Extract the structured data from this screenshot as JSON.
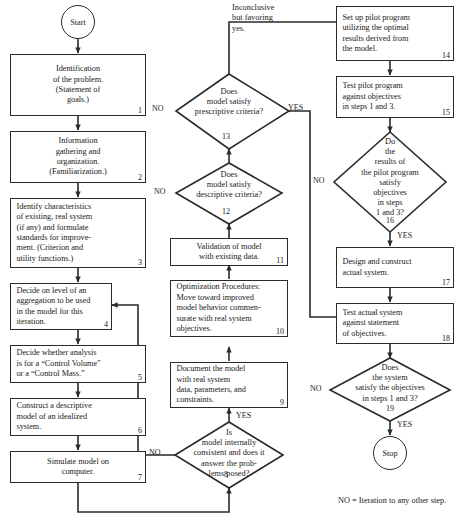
{
  "diagram": {
    "legend": "NO = Iteration to any other step.",
    "line_color": "#2a2a2a",
    "background": "#ffffff"
  },
  "terminators": {
    "start": "Start",
    "stop": "Stop"
  },
  "steps": [
    {
      "id": 1,
      "num": "1",
      "lines": [
        "Identification",
        "of the problem.",
        "(Statement of",
        "goals.)"
      ]
    },
    {
      "id": 2,
      "num": "2",
      "lines": [
        "Information",
        "gathering and",
        "organization.",
        "(Familiarization.)"
      ]
    },
    {
      "id": 3,
      "num": "3",
      "lines": [
        "Identify characteristics",
        "of existing, real system",
        "(if any) and formulate",
        "standards for improve-",
        "ment. (Criterion and",
        "utility functions.)"
      ]
    },
    {
      "id": 4,
      "num": "4",
      "lines": [
        "Decide on level of an",
        "aggregation to be used",
        "in the model for this",
        "iteration."
      ]
    },
    {
      "id": 5,
      "num": "5",
      "lines": [
        "Decide whether analysis",
        "is for a “Control Volume”",
        "or a “Control Mass.”"
      ]
    },
    {
      "id": 6,
      "num": "6",
      "lines": [
        "Construct a descriptive",
        "model of an idealized",
        "system."
      ]
    },
    {
      "id": 7,
      "num": "7",
      "lines": [
        "Simulate model on",
        "computer."
      ]
    },
    {
      "id": 9,
      "num": "9",
      "lines": [
        "Document the model",
        "with real system",
        "data, parameters, and",
        "constraints."
      ]
    },
    {
      "id": 10,
      "num": "10",
      "lines": [
        "Optimization Procedures:",
        "Move toward improved",
        "model behavior commen-",
        "surate with real system",
        "objectives."
      ]
    },
    {
      "id": 11,
      "num": "11",
      "lines": [
        "Validation of model",
        "with existing data."
      ]
    },
    {
      "id": 14,
      "num": "14",
      "lines": [
        "Set up pilot program",
        "utilizing the optimal",
        "results derived from",
        "the model."
      ]
    },
    {
      "id": 15,
      "num": "15",
      "lines": [
        "Test pilot program",
        "against objectives",
        "in steps 1 and 3."
      ]
    },
    {
      "id": 17,
      "num": "17",
      "lines": [
        "Design and construct",
        "actual system."
      ]
    },
    {
      "id": 18,
      "num": "18",
      "lines": [
        "Test actual system",
        "against statement",
        "of objectives."
      ]
    }
  ],
  "decisions": [
    {
      "id": 8,
      "num": "8",
      "lines": [
        "Is",
        "model internally",
        "consistent and does it",
        "answer the prob-",
        "lems posed?"
      ],
      "no_label": "NO",
      "yes_label": "YES"
    },
    {
      "id": 12,
      "num": "12",
      "lines": [
        "Does",
        "model satisfy",
        "descriptive criteria?"
      ],
      "no_label": "NO",
      "yes_label": ""
    },
    {
      "id": 13,
      "num": "13",
      "lines": [
        "Does",
        "model satisfy",
        "prescriptive criteria?"
      ],
      "no_label": "NO",
      "yes_label": "YES"
    },
    {
      "id": 16,
      "num": "16",
      "lines": [
        "Do",
        "the",
        "results of",
        "the pilot program",
        "satisfy",
        "objectives",
        "in steps",
        "1 and 3?"
      ],
      "no_label": "NO",
      "yes_label": "YES"
    },
    {
      "id": 19,
      "num": "19",
      "lines": [
        "Does",
        "the system",
        "satisfy the objectives",
        "in steps 1 and 3?"
      ],
      "no_label": "NO",
      "yes_label": "YES"
    }
  ],
  "annotations": {
    "inconclusive_note": [
      "Inconclusive",
      "but favoring",
      "yes."
    ]
  }
}
